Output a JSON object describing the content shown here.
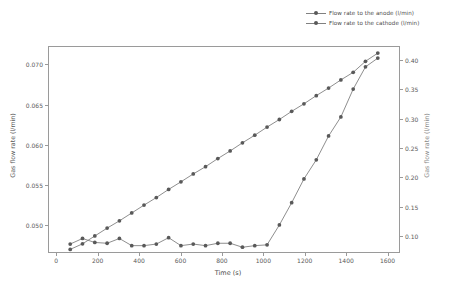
{
  "chart_data": {
    "type": "line",
    "title": "",
    "xlabel": "Time (s)",
    "ylabel": "Gas flow rate (l/min)",
    "ylabel_right": "Gas flow rate (l/min)",
    "xlim": [
      -40,
      1660
    ],
    "ylim_left": [
      0.0465,
      0.0723
    ],
    "ylim_right": [
      0.0715,
      0.4235
    ],
    "xticks": [
      0,
      200,
      400,
      600,
      800,
      1000,
      1200,
      1400,
      1600
    ],
    "xticklabels": [
      "0",
      "200",
      "400",
      "600",
      "800",
      "1000",
      "1200",
      "1400",
      "1600"
    ],
    "yticks_left": [
      0.05,
      0.055,
      0.06,
      0.065,
      0.07
    ],
    "yticklabels_left": [
      "0.050",
      "0.055",
      "0.060",
      "0.065",
      "0.070"
    ],
    "yticks_right": [
      0.1,
      0.15,
      0.2,
      0.25,
      0.3,
      0.35,
      0.4
    ],
    "yticklabels_right": [
      "0.10",
      "0.15",
      "0.20",
      "0.25",
      "0.30",
      "0.35",
      "0.40"
    ],
    "grid": false,
    "legend_position": "upper right",
    "line_color": "#808080",
    "marker_color": "#595959",
    "series": [
      {
        "name": "Flow rate to the anode (l/min)",
        "axis": "left",
        "marker": "circle",
        "x": [
          60,
          120,
          180,
          240,
          300,
          360,
          420,
          480,
          540,
          600,
          660,
          720,
          780,
          840,
          900,
          960,
          1020,
          1080,
          1140,
          1200,
          1260,
          1320,
          1380,
          1440,
          1500,
          1560
        ],
        "y": [
          0.0475,
          0.0482,
          0.0477,
          0.0476,
          0.0482,
          0.0473,
          0.0473,
          0.0475,
          0.0483,
          0.0473,
          0.0475,
          0.0473,
          0.0476,
          0.0476,
          0.0471,
          0.0473,
          0.0474,
          0.0499,
          0.0527,
          0.0557,
          0.0581,
          0.0611,
          0.0635,
          0.067,
          0.0698,
          0.0709
        ]
      },
      {
        "name": "Flow rate to the cathode (l/min)",
        "axis": "right",
        "marker": "circle",
        "x": [
          60,
          120,
          180,
          240,
          300,
          360,
          420,
          480,
          540,
          600,
          660,
          720,
          780,
          840,
          900,
          960,
          1020,
          1080,
          1140,
          1200,
          1260,
          1320,
          1380,
          1440,
          1500,
          1560
        ],
        "y": [
          0.076,
          0.0855,
          0.099,
          0.1125,
          0.125,
          0.1385,
          0.152,
          0.165,
          0.179,
          0.192,
          0.2055,
          0.218,
          0.232,
          0.245,
          0.259,
          0.272,
          0.286,
          0.299,
          0.313,
          0.326,
          0.34,
          0.353,
          0.367,
          0.38,
          0.399,
          0.413
        ]
      }
    ]
  },
  "legend": {
    "entries": [
      {
        "label": "Flow rate to the anode (l/min)"
      },
      {
        "label": "Flow rate to the cathode (l/min)"
      }
    ]
  },
  "axes": {
    "xlabel": "Time (s)",
    "ylabel_left": "Gas flow rate (l/min)",
    "ylabel_right": "Gas flow rate (l/min)"
  }
}
